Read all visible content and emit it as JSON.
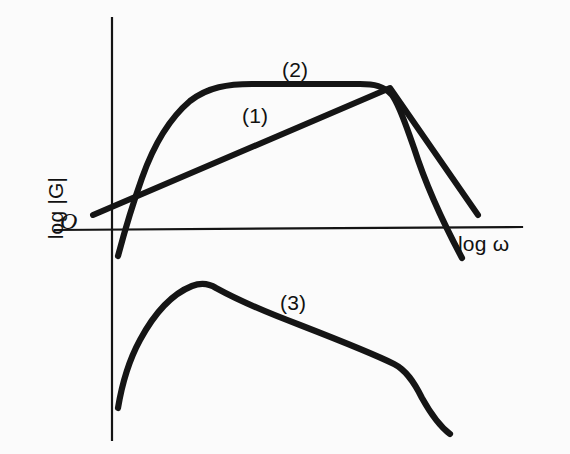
{
  "figure": {
    "background_color": "#fbfbfb",
    "ink_color": "#151515",
    "origin_label": "O",
    "y_axis_label": "log |G|",
    "x_axis_label": "log ω",
    "curve_label_1": "(1)",
    "curve_label_2": "(2)",
    "curve_label_3": "(3)"
  },
  "chart_data": {
    "type": "line",
    "title": "",
    "subtitle": "",
    "xlabel": "log ω",
    "ylabel": "log |G|",
    "grid": false,
    "legend": "inline-annotations",
    "axes": {
      "x_axis_pixel_y": 229,
      "y_axis_pixel_x": 112,
      "upper_panel_region": [
        18,
        262
      ],
      "lower_panel_region": [
        262,
        440
      ],
      "ticks": [],
      "tick_labels": [],
      "origin_marker": "O"
    },
    "annotations": [
      {
        "text": "(1)",
        "x": 242,
        "y": 104,
        "refers_to": "series-1"
      },
      {
        "text": "(2)",
        "x": 282,
        "y": 58,
        "refers_to": "series-2"
      },
      {
        "text": "(3)",
        "x": 280,
        "y": 291,
        "refers_to": "series-3"
      }
    ],
    "series": [
      {
        "name": "(1)",
        "description": "Straight rising line (constant positive slope) that peaks at the plateau end and then falls with a moderate negative slope; ends above the log-omega axis.",
        "shape": "piecewise-linear",
        "panel": "upper",
        "points_px": [
          [
            93,
            215
          ],
          [
            390,
            88
          ],
          [
            478,
            215
          ]
        ],
        "path_d": "M 93 215 L 390 88 L 478 215"
      },
      {
        "name": "(2)",
        "description": "Band-pass magnitude curve: steep low-frequency rise from below the axis, rounded corner onto a flat plateau, then a rounded corner into a very steep high-frequency roll-off crossing the axis.",
        "shape": "smooth-plateau",
        "panel": "upper",
        "points_px": [
          [
            118,
            256
          ],
          [
            132,
            200
          ],
          [
            150,
            155
          ],
          [
            170,
            120
          ],
          [
            190,
            98
          ],
          [
            212,
            88
          ],
          [
            240,
            85
          ],
          [
            300,
            84
          ],
          [
            360,
            84
          ],
          [
            382,
            86
          ],
          [
            396,
            96
          ],
          [
            408,
            120
          ],
          [
            430,
            180
          ],
          [
            462,
            258
          ]
        ],
        "path_d": "M 118 256 C 126 226 132 206 142 178 C 154 144 170 118 190 101 C 208 87 228 84 252 84 L 360 84 C 374 84 384 86 392 95 C 400 106 406 126 414 148 C 428 192 446 228 462 258"
      },
      {
        "name": "(3)",
        "description": "Lower-panel response: sharp rise from bottom-left to a rounded maximum, gradual near-linear decay, a knee, then a steeper final drop.",
        "shape": "peak-decay",
        "panel": "lower",
        "points_px": [
          [
            118,
            408
          ],
          [
            130,
            360
          ],
          [
            145,
            330
          ],
          [
            165,
            305
          ],
          [
            185,
            290
          ],
          [
            203,
            284
          ],
          [
            225,
            292
          ],
          [
            260,
            308
          ],
          [
            310,
            330
          ],
          [
            360,
            350
          ],
          [
            395,
            364
          ],
          [
            412,
            376
          ],
          [
            428,
            398
          ],
          [
            443,
            424
          ],
          [
            450,
            434
          ]
        ],
        "path_d": "M 118 408 C 122 384 128 362 140 340 C 154 314 172 294 192 286 C 200 283 208 283 216 288 C 236 299 268 313 300 325 C 336 339 372 353 394 364 C 406 370 414 382 422 398 C 432 416 442 428 450 434"
      }
    ]
  }
}
